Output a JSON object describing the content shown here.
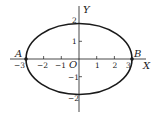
{
  "diagram": {
    "type": "ellipse-on-axes",
    "equation_semi_axes": {
      "a": 3,
      "b": 2
    },
    "colors": {
      "stroke": "#1a1a1a",
      "text": "#222222",
      "background": "#ffffff"
    },
    "axes": {
      "x_label": "X",
      "y_label": "Y",
      "origin_label": "O",
      "x_ticks": [
        {
          "value": -3,
          "label": "−3"
        },
        {
          "value": -2,
          "label": "−2"
        },
        {
          "value": -1,
          "label": "−1"
        },
        {
          "value": 1,
          "label": "1"
        },
        {
          "value": 2,
          "label": "2"
        },
        {
          "value": 3,
          "label": "3"
        }
      ],
      "y_ticks": [
        {
          "value": 2,
          "label": "2"
        },
        {
          "value": 1,
          "label": "1"
        },
        {
          "value": -1,
          "label": "−1"
        },
        {
          "value": -2,
          "label": "−2"
        }
      ]
    },
    "points": [
      {
        "name": "A",
        "x": -3,
        "y": 0
      },
      {
        "name": "B",
        "x": 3,
        "y": 0
      }
    ]
  }
}
